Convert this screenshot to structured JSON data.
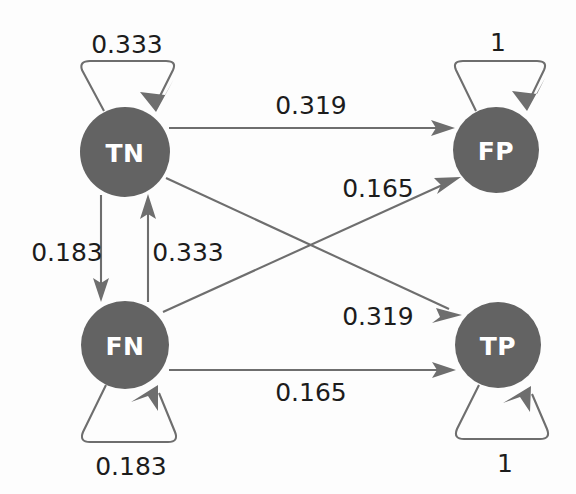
{
  "diagram": {
    "type": "state-transition-graph",
    "title": "",
    "node_fill_color": "#636363",
    "node_label_color": "#ffffff",
    "edge_color": "#6e6e6e",
    "label_color": "#1c1c1c",
    "background_color": "#fdfdfd",
    "nodes": [
      {
        "id": "TN",
        "label": "TN",
        "cx": 125,
        "cy": 152,
        "r": 45
      },
      {
        "id": "FP",
        "label": "FP",
        "cx": 496,
        "cy": 150,
        "r": 43
      },
      {
        "id": "FN",
        "label": "FN",
        "cx": 125,
        "cy": 345,
        "r": 44
      },
      {
        "id": "TP",
        "label": "TP",
        "cx": 498,
        "cy": 345,
        "r": 43
      }
    ],
    "edges": [
      {
        "id": "tn-tn",
        "from": "TN",
        "to": "TN",
        "label": "0.333",
        "kind": "self-loop-up",
        "label_x": 127,
        "label_y": 44
      },
      {
        "id": "fp-fp",
        "from": "FP",
        "to": "FP",
        "label": "1",
        "kind": "self-loop-up",
        "label_x": 498,
        "label_y": 42
      },
      {
        "id": "fn-fn",
        "from": "FN",
        "to": "FN",
        "label": "0.183",
        "kind": "self-loop-down",
        "label_x": 131,
        "label_y": 466
      },
      {
        "id": "tp-tp",
        "from": "TP",
        "to": "TP",
        "label": "1",
        "kind": "self-loop-down",
        "label_x": 505,
        "label_y": 463
      },
      {
        "id": "tn-fp",
        "from": "TN",
        "to": "FP",
        "label": "0.319",
        "kind": "straight-horizontal",
        "label_x": 311,
        "label_y": 105
      },
      {
        "id": "tn-fn",
        "from": "TN",
        "to": "FN",
        "label": "0.183",
        "kind": "straight-vertical-down",
        "label_x": 67,
        "label_y": 252
      },
      {
        "id": "fn-tn",
        "from": "FN",
        "to": "TN",
        "label": "0.333",
        "kind": "straight-vertical-up",
        "label_x": 188,
        "label_y": 252
      },
      {
        "id": "fn-fp",
        "from": "FN",
        "to": "FP",
        "label": "0.165",
        "kind": "diagonal-up-right",
        "label_x": 378,
        "label_y": 188
      },
      {
        "id": "tn-tp",
        "from": "TN",
        "to": "TP",
        "label": "0.319",
        "kind": "diagonal-down-right",
        "label_x": 378,
        "label_y": 316
      },
      {
        "id": "fn-tp",
        "from": "FN",
        "to": "TP",
        "label": "0.165",
        "kind": "straight-horizontal",
        "label_x": 311,
        "label_y": 392
      }
    ]
  }
}
